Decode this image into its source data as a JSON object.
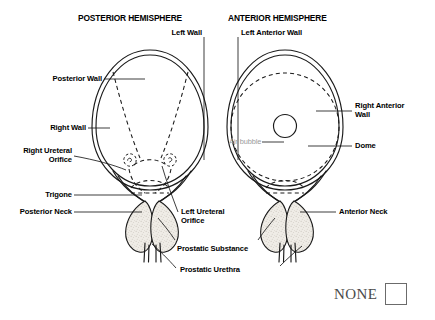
{
  "figure": {
    "titles": {
      "posterior": "POSTERIOR HEMISPHERE",
      "anterior": "ANTERIOR HEMISPHERE"
    },
    "labels": {
      "left_wall": "Left Wall",
      "left_anterior_wall": "Left Anterior Wall",
      "posterior_wall": "Posterior Wall",
      "right_wall": "Right Wall",
      "right_ureteral_orifice": "Right Ureteral\nOrifice",
      "trigone": "Trigone",
      "posterior_neck": "Posterior Neck",
      "left_ureteral_orifice": "Left Ureteral\nOrifice",
      "prostatic_substance": "Prostatic Substance",
      "prostatic_urethra": "Prostatic Urethra",
      "right_anterior_wall": "Right Anterior\nWall",
      "dome": "Dome",
      "anterior_neck": "Anterior Neck",
      "air_bubble": "Air bubble"
    },
    "colors": {
      "stroke": "#1a1a1a",
      "faint_text": "#9a9a9a",
      "prostate_fill": "#e8e4dc",
      "checkbox_border": "#6b6b6b",
      "none_text": "#4a4a4a",
      "background": "#ffffff"
    }
  },
  "footer": {
    "none_label": "NONE"
  }
}
